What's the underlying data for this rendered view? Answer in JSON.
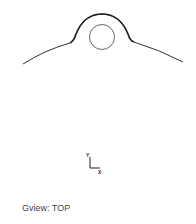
{
  "viewport": {
    "view_label_prefix": "Gview:",
    "view_name": "TOP",
    "view_label": "Gview: TOP"
  },
  "axis_indicator": {
    "y_label": "Y",
    "x_label": "X"
  },
  "colors": {
    "background": "#ffffff",
    "geometry_stroke": "#333333",
    "text": "#444444"
  }
}
